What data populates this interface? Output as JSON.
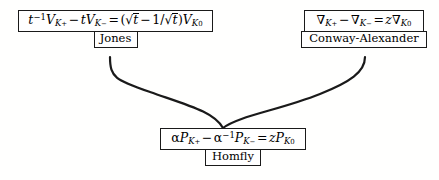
{
  "diagram": {
    "background_color": "#fffffe",
    "line_color": "#1a1a1a",
    "nodes": [
      {
        "id": "jones",
        "label": "Jones",
        "formula_text": "t^-1 V_{K_+} - t V_{K_-} = (sqrt(t) - 1/sqrt(t)) V_{K_0}",
        "parts": {
          "t": "t",
          "exp_minus_one": "−1",
          "V": "V",
          "K": "K",
          "plus": "+",
          "minus": "−",
          "zero": "0",
          "op_minus": "−",
          "op_equals": "=",
          "lparen": "(",
          "rparen": ")",
          "sqrt": "√",
          "one_over": "1/"
        }
      },
      {
        "id": "conway",
        "label": "Conway-Alexander",
        "formula_text": "nabla_{K_+} - nabla_{K_-} = z nabla_{K_0}",
        "parts": {
          "nabla": "∇",
          "K": "K",
          "plus": "+",
          "minus": "−",
          "zero": "0",
          "op_minus": "−",
          "op_equals": "=",
          "z": "z"
        }
      },
      {
        "id": "homfly",
        "label": "Homfly",
        "formula_text": "alpha P_{K_+} - alpha^-1 P_{K_-} = z P_{K_0}",
        "parts": {
          "alpha": "α",
          "P": "P",
          "K": "K",
          "plus": "+",
          "minus": "−",
          "zero": "0",
          "exp_minus_one": "−1",
          "op_minus": "−",
          "op_equals": "=",
          "z": "z"
        }
      }
    ],
    "edges": [
      {
        "id": "jones-to-homfly",
        "from": "jones",
        "to": "homfly",
        "style": "curve"
      },
      {
        "id": "conway-to-homfly",
        "from": "conway",
        "to": "homfly",
        "style": "curve"
      }
    ]
  }
}
